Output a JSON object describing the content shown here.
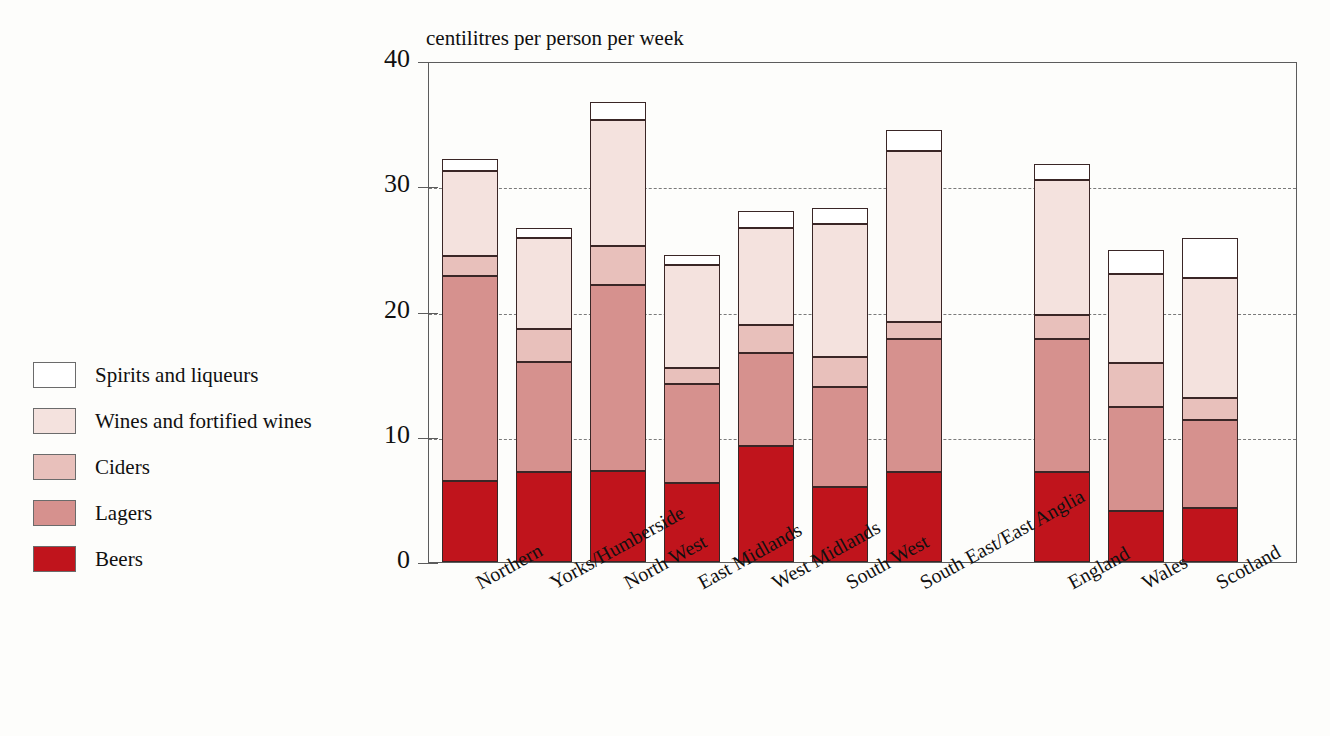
{
  "chart_data": {
    "type": "bar",
    "subtype": "stacked-bar",
    "title": "centilitres per person per week",
    "xlabel": "",
    "ylabel": "centilitres per person per week",
    "ylim": [
      0,
      40
    ],
    "yticks": [
      "0",
      "10",
      "20",
      "30",
      "40"
    ],
    "ytick_values": [
      0,
      10,
      20,
      30,
      40
    ],
    "grid": "horizontal-dashed-at-10-20-30",
    "legend_position": "left",
    "categories": [
      "Northern",
      "Yorks/Humberside",
      "North West",
      "East Midlands",
      "West Midlands",
      "South West",
      "South East/East Anglia",
      "England",
      "Wales",
      "Scotland"
    ],
    "series": [
      {
        "name": "Beers",
        "color": "#c0141c",
        "values": [
          6.5,
          7.2,
          7.3,
          6.3,
          9.3,
          6.0,
          7.2,
          7.2,
          4.1,
          4.3
        ]
      },
      {
        "name": "Lagers",
        "color": "#d6918e",
        "values": [
          16.3,
          8.8,
          14.8,
          7.9,
          7.4,
          8.0,
          10.6,
          10.6,
          8.3,
          7.0
        ]
      },
      {
        "name": "Ciders",
        "color": "#e8c0bb",
        "values": [
          1.6,
          2.6,
          3.1,
          1.3,
          2.2,
          2.4,
          1.4,
          1.9,
          3.5,
          1.8
        ]
      },
      {
        "name": "Wines and fortified wines",
        "color": "#f4e2de",
        "values": [
          6.8,
          7.3,
          10.1,
          8.2,
          7.8,
          10.6,
          13.6,
          10.8,
          7.1,
          9.6
        ]
      },
      {
        "name": "Spirits and liqueurs",
        "color": "#ffffff",
        "values": [
          1.0,
          0.8,
          1.4,
          0.8,
          1.3,
          1.3,
          1.7,
          1.3,
          1.9,
          3.2
        ]
      }
    ],
    "totals": [
      32.2,
      26.7,
      36.7,
      24.5,
      28.0,
      28.3,
      34.5,
      31.8,
      24.9,
      25.9
    ]
  },
  "legend": {
    "items": [
      {
        "label": "Spirits and liqueurs",
        "color": "#ffffff"
      },
      {
        "label": "Wines and fortified wines",
        "color": "#f4e2de"
      },
      {
        "label": "Ciders",
        "color": "#e8c0bb"
      },
      {
        "label": "Lagers",
        "color": "#d6918e"
      },
      {
        "label": "Beers",
        "color": "#c0141c"
      }
    ]
  }
}
